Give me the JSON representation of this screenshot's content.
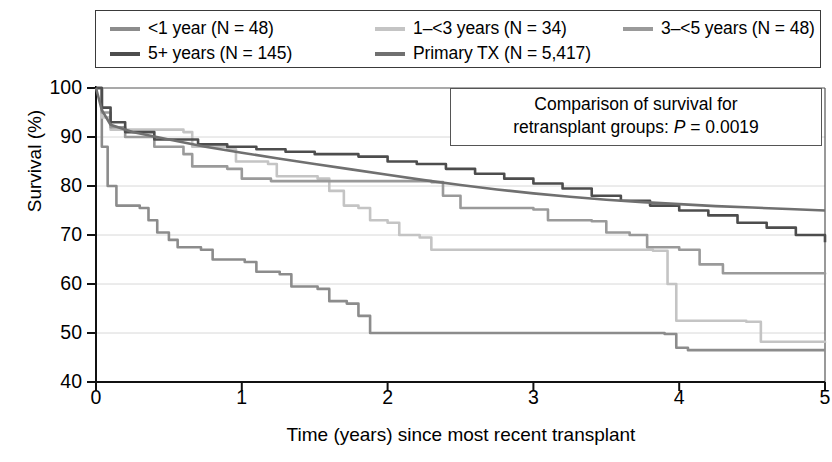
{
  "legend": {
    "rows": [
      [
        {
          "label": "<1 year (N = 48)",
          "color": "#8c8c8c",
          "key": "lt1"
        },
        {
          "label": "1–<3 years (N = 34)",
          "color": "#c4c4c4",
          "key": "y1to3"
        },
        {
          "label": "3–<5 years (N = 48)",
          "color": "#9a9a9a",
          "key": "y3to5"
        }
      ],
      [
        {
          "label": "5+ years (N = 145)",
          "color": "#4d4d4d",
          "key": "y5plus"
        },
        {
          "label": "Primary TX (N = 5,417)",
          "color": "#707070",
          "key": "primary"
        }
      ]
    ]
  },
  "annotation": {
    "line1": "Comparison of survival for",
    "line2_pre": "retransplant groups: ",
    "line2_p": "P",
    "line2_post": " = 0.0019"
  },
  "axes": {
    "ylabel": "Survival (%)",
    "xlabel": "Time (years) since most recent transplant",
    "yticks": [
      "100",
      "90",
      "80",
      "70",
      "60",
      "50",
      "40"
    ],
    "xticks": [
      "0",
      "1",
      "2",
      "3",
      "4",
      "5"
    ]
  },
  "chart_data": {
    "type": "line",
    "title": "",
    "xlabel": "Time (years) since most recent transplant",
    "ylabel": "Survival (%)",
    "xlim": [
      0,
      5
    ],
    "ylim": [
      40,
      100
    ],
    "yticks": [
      40,
      50,
      60,
      70,
      80,
      90,
      100
    ],
    "xticks": [
      0,
      1,
      2,
      3,
      4,
      5
    ],
    "grid": "horizontal",
    "legend_position": "above-plot",
    "annotation": "Comparison of survival for retransplant groups: P = 0.0019",
    "step_style": "post",
    "series": [
      {
        "name": "<1 year (N = 48)",
        "n": 48,
        "color": "#8c8c8c",
        "final_value": 46.5,
        "points": [
          [
            0.0,
            100.0
          ],
          [
            0.04,
            88.0
          ],
          [
            0.08,
            80.0
          ],
          [
            0.14,
            76.0
          ],
          [
            0.3,
            75.5
          ],
          [
            0.36,
            73.0
          ],
          [
            0.42,
            70.5
          ],
          [
            0.5,
            69.0
          ],
          [
            0.56,
            67.5
          ],
          [
            0.72,
            67.0
          ],
          [
            0.8,
            65.0
          ],
          [
            1.02,
            64.5
          ],
          [
            1.1,
            62.5
          ],
          [
            1.26,
            62.0
          ],
          [
            1.34,
            59.5
          ],
          [
            1.52,
            59.0
          ],
          [
            1.6,
            56.5
          ],
          [
            1.72,
            56.0
          ],
          [
            1.8,
            53.5
          ],
          [
            1.88,
            50.0
          ],
          [
            3.9,
            49.8
          ],
          [
            3.98,
            47.0
          ],
          [
            4.06,
            46.5
          ],
          [
            5.0,
            46.5
          ]
        ]
      },
      {
        "name": "1–<3 years (N = 34)",
        "n": 34,
        "color": "#c4c4c4",
        "final_value": 48.0,
        "points": [
          [
            0.0,
            100.0
          ],
          [
            0.04,
            94.0
          ],
          [
            0.1,
            91.5
          ],
          [
            0.6,
            91.0
          ],
          [
            0.66,
            88.0
          ],
          [
            0.9,
            87.5
          ],
          [
            0.96,
            85.0
          ],
          [
            1.18,
            84.5
          ],
          [
            1.24,
            82.0
          ],
          [
            1.52,
            81.5
          ],
          [
            1.6,
            79.0
          ],
          [
            1.7,
            76.0
          ],
          [
            1.8,
            75.5
          ],
          [
            1.88,
            73.0
          ],
          [
            2.0,
            72.5
          ],
          [
            2.08,
            70.0
          ],
          [
            2.22,
            69.5
          ],
          [
            2.3,
            67.0
          ],
          [
            3.82,
            66.8
          ],
          [
            3.92,
            60.0
          ],
          [
            3.98,
            52.5
          ],
          [
            4.46,
            52.3
          ],
          [
            4.56,
            48.2
          ],
          [
            5.0,
            48.0
          ]
        ]
      },
      {
        "name": "3–<5 years (N = 48)",
        "n": 48,
        "color": "#9a9a9a",
        "final_value": 62.0,
        "points": [
          [
            0.0,
            100.0
          ],
          [
            0.04,
            95.0
          ],
          [
            0.1,
            92.0
          ],
          [
            0.2,
            90.0
          ],
          [
            0.4,
            88.0
          ],
          [
            0.6,
            86.5
          ],
          [
            0.66,
            84.0
          ],
          [
            0.9,
            83.5
          ],
          [
            1.0,
            81.5
          ],
          [
            1.2,
            81.0
          ],
          [
            2.3,
            80.8
          ],
          [
            2.38,
            78.0
          ],
          [
            2.5,
            75.5
          ],
          [
            3.0,
            75.2
          ],
          [
            3.1,
            73.0
          ],
          [
            3.4,
            72.8
          ],
          [
            3.5,
            70.5
          ],
          [
            3.66,
            70.0
          ],
          [
            3.78,
            67.5
          ],
          [
            4.0,
            67.0
          ],
          [
            4.14,
            64.0
          ],
          [
            4.3,
            62.2
          ],
          [
            5.0,
            62.0
          ]
        ]
      },
      {
        "name": "5+ years (N = 145)",
        "n": 145,
        "color": "#4d4d4d",
        "final_value": 68.5,
        "points": [
          [
            0.0,
            100.0
          ],
          [
            0.04,
            96.0
          ],
          [
            0.1,
            93.0
          ],
          [
            0.2,
            91.0
          ],
          [
            0.4,
            89.5
          ],
          [
            0.7,
            88.5
          ],
          [
            0.9,
            88.0
          ],
          [
            1.1,
            87.5
          ],
          [
            1.3,
            87.0
          ],
          [
            1.5,
            86.5
          ],
          [
            1.8,
            86.0
          ],
          [
            2.0,
            85.0
          ],
          [
            2.2,
            84.5
          ],
          [
            2.4,
            83.5
          ],
          [
            2.6,
            82.5
          ],
          [
            2.8,
            81.5
          ],
          [
            3.0,
            80.5
          ],
          [
            3.2,
            79.5
          ],
          [
            3.4,
            78.0
          ],
          [
            3.6,
            77.0
          ],
          [
            3.8,
            76.0
          ],
          [
            4.0,
            75.0
          ],
          [
            4.2,
            74.0
          ],
          [
            4.4,
            72.5
          ],
          [
            4.6,
            71.5
          ],
          [
            4.8,
            70.0
          ],
          [
            5.0,
            68.5
          ]
        ]
      },
      {
        "name": "Primary TX (N = 5,417)",
        "n": 5417,
        "color": "#707070",
        "final_value": 75.0,
        "points": [
          [
            0.0,
            100.0
          ],
          [
            0.04,
            95.5
          ],
          [
            0.1,
            92.5
          ],
          [
            0.25,
            91.0
          ],
          [
            0.5,
            89.5
          ],
          [
            0.75,
            88.0
          ],
          [
            1.0,
            86.8
          ],
          [
            1.25,
            85.6
          ],
          [
            1.5,
            84.5
          ],
          [
            1.75,
            83.4
          ],
          [
            2.0,
            82.3
          ],
          [
            2.25,
            81.2
          ],
          [
            2.5,
            80.2
          ],
          [
            2.75,
            79.3
          ],
          [
            3.0,
            78.5
          ],
          [
            3.25,
            77.8
          ],
          [
            3.5,
            77.2
          ],
          [
            3.75,
            76.7
          ],
          [
            4.0,
            76.3
          ],
          [
            4.25,
            75.9
          ],
          [
            4.5,
            75.6
          ],
          [
            4.75,
            75.3
          ],
          [
            5.0,
            75.0
          ]
        ]
      }
    ]
  },
  "plot_geometry": {
    "left": 96,
    "right": 825,
    "top": 88,
    "bottom": 382
  }
}
